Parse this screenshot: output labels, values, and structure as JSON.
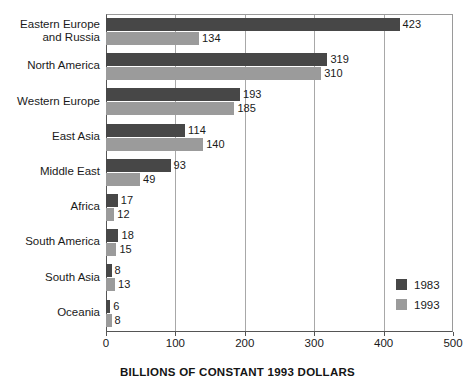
{
  "chart_data": {
    "type": "bar",
    "orientation": "horizontal",
    "title": "",
    "xlabel": "BILLIONS OF CONSTANT 1993 DOLLARS",
    "ylabel": "",
    "xlim": [
      0,
      500
    ],
    "xticks": [
      0,
      100,
      200,
      300,
      400,
      500
    ],
    "grid": "vertical",
    "legend_position": "inside-bottom-right",
    "categories": [
      "Eastern Europe\nand Russia",
      "North America",
      "Western Europe",
      "East Asia",
      "Middle East",
      "Africa",
      "South America",
      "South Asia",
      "Oceania"
    ],
    "series": [
      {
        "name": "1983",
        "color": "#474747",
        "values": [
          423,
          319,
          193,
          114,
          93,
          17,
          18,
          8,
          6
        ]
      },
      {
        "name": "1993",
        "color": "#9b9b9b",
        "values": [
          134,
          310,
          185,
          140,
          49,
          12,
          15,
          13,
          8
        ]
      }
    ]
  },
  "legend": {
    "items": [
      {
        "label": "1983",
        "color": "#474747"
      },
      {
        "label": "1993",
        "color": "#9b9b9b"
      }
    ]
  },
  "axis": {
    "x_title": "BILLIONS OF CONSTANT 1993 DOLLARS",
    "tick_labels": [
      "0",
      "100",
      "200",
      "300",
      "400",
      "500"
    ]
  }
}
